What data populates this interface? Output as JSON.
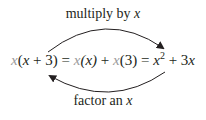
{
  "top_arrow": {
    "label_text": "multiply by ",
    "label_var": "x"
  },
  "bottom_arrow": {
    "label_text": "factor an ",
    "label_var": "x"
  },
  "equation": {
    "lhs": {
      "factor": "x",
      "open": "(",
      "inner_var": "x",
      "inner_rest": " + 3)"
    },
    "eq1": " = ",
    "term1": {
      "factor": "x",
      "paren": "(x)"
    },
    "plus1": " + ",
    "term2": {
      "factor": "x",
      "paren": "(3)"
    },
    "eq2": " = ",
    "result": {
      "var1": "x",
      "exp": "2",
      "rest": " + 3",
      "var2": "x"
    }
  },
  "colors": {
    "text": "#231f20",
    "highlight_x": "#9b9b9b",
    "arrow": "#231f20"
  }
}
